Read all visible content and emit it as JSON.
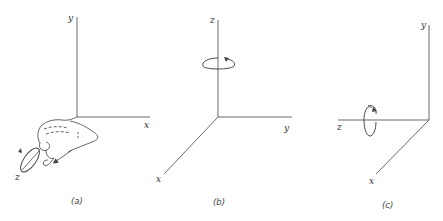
{
  "figure": {
    "panels": [
      {
        "id": "a",
        "caption": "(a)",
        "axes": {
          "up": "y",
          "right": "x",
          "diagonal": "z"
        },
        "rotation_axis": "z",
        "illustration": "right-hand-rule"
      },
      {
        "id": "b",
        "caption": "(b)",
        "axes": {
          "up": "z",
          "right": "y",
          "diagonal": "x"
        },
        "rotation_axis": "z"
      },
      {
        "id": "c",
        "caption": "(c)",
        "axes": {
          "up": "y",
          "left": "z",
          "diagonal": "x"
        },
        "rotation_axis": "z"
      }
    ]
  },
  "colors": {
    "axis": "#6a6a6a",
    "text": "#333333",
    "background": "#ffffff"
  }
}
